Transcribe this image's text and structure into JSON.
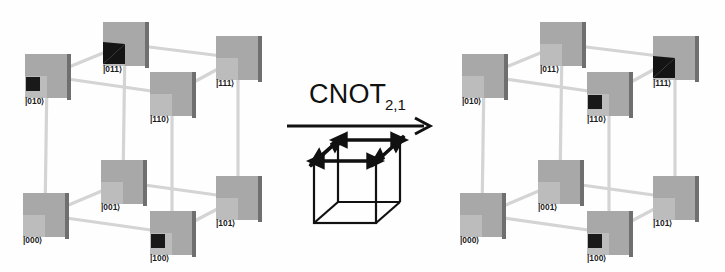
{
  "figure": {
    "type": "quantum-state-cube-diagram",
    "background_color": "#fefefe",
    "width": 725,
    "height": 272
  },
  "operation": {
    "name": "CNOT",
    "subscript": "2,1",
    "arrow": "right-arrow",
    "description_icon": "wireframe-cube-with-edge-arrows"
  },
  "style": {
    "panel_face_color": "#a8a8a8",
    "panel_subsquare_color": "#bdbdbd",
    "panel_edge_color": "#6f6f6f",
    "panel_mark_color": "#161616",
    "edge_color": "#d2d2d2",
    "label_color": "#1a1a1a",
    "line_color": "#111111"
  },
  "cube_geometry": {
    "note": "Basis-state node screen positions within each 290x272 cube panel",
    "nodes": {
      "000": {
        "x": 45,
        "y": 215,
        "label_dx": -8,
        "label_dy": 26
      },
      "001": {
        "x": 123,
        "y": 182,
        "label_dx": -8,
        "label_dy": 26
      },
      "100": {
        "x": 172,
        "y": 233,
        "label_dx": -8,
        "label_dy": 26
      },
      "101": {
        "x": 238,
        "y": 198,
        "label_dx": -8,
        "label_dy": 26
      },
      "010": {
        "x": 47,
        "y": 76,
        "label_dx": -8,
        "label_dy": 26
      },
      "011": {
        "x": 125,
        "y": 44,
        "label_dx": -8,
        "label_dy": 26
      },
      "110": {
        "x": 172,
        "y": 94,
        "label_dx": -8,
        "label_dy": 26
      },
      "111": {
        "x": 238,
        "y": 58,
        "label_dx": -8,
        "label_dy": 26
      }
    },
    "edges": [
      [
        "000",
        "001"
      ],
      [
        "001",
        "101"
      ],
      [
        "101",
        "100"
      ],
      [
        "100",
        "000"
      ],
      [
        "010",
        "011"
      ],
      [
        "011",
        "111"
      ],
      [
        "111",
        "110"
      ],
      [
        "110",
        "010"
      ],
      [
        "000",
        "010"
      ],
      [
        "001",
        "011"
      ],
      [
        "100",
        "110"
      ],
      [
        "101",
        "111"
      ]
    ]
  },
  "cube_before": {
    "name": "input-state-cube",
    "caption": "before CNOT",
    "nodes": [
      {
        "id": "000",
        "label": "|000⟩",
        "mark": "none"
      },
      {
        "id": "001",
        "label": "|001⟩",
        "mark": "none"
      },
      {
        "id": "010",
        "label": "|010⟩",
        "mark": "square"
      },
      {
        "id": "011",
        "label": "|011⟩",
        "mark": "wedge"
      },
      {
        "id": "100",
        "label": "|100⟩",
        "mark": "square"
      },
      {
        "id": "101",
        "label": "|101⟩",
        "mark": "none"
      },
      {
        "id": "110",
        "label": "|110⟩",
        "mark": "none"
      },
      {
        "id": "111",
        "label": "|111⟩",
        "mark": "none"
      }
    ]
  },
  "cube_after": {
    "name": "output-state-cube",
    "caption": "after CNOT",
    "nodes": [
      {
        "id": "000",
        "label": "|000⟩",
        "mark": "none"
      },
      {
        "id": "001",
        "label": "|001⟩",
        "mark": "none"
      },
      {
        "id": "010",
        "label": "|010⟩",
        "mark": "none"
      },
      {
        "id": "011",
        "label": "|011⟩",
        "mark": "none"
      },
      {
        "id": "100",
        "label": "|100⟩",
        "mark": "square"
      },
      {
        "id": "101",
        "label": "|101⟩",
        "mark": "none"
      },
      {
        "id": "110",
        "label": "|110⟩",
        "mark": "square"
      },
      {
        "id": "111",
        "label": "|111⟩",
        "mark": "wedge"
      }
    ]
  }
}
